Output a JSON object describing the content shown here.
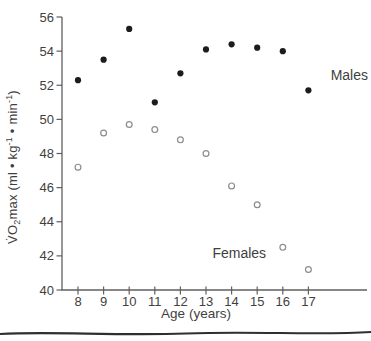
{
  "figure": {
    "background": "#ffffff",
    "axis_color": "#606060",
    "text_color": "#3f3f3f",
    "separator_color": "#2f2f2f"
  },
  "chart_data": {
    "type": "scatter",
    "title": "",
    "x": [
      8,
      9,
      10,
      11,
      12,
      13,
      14,
      15,
      16,
      17
    ],
    "xlabel": "Age (years)",
    "ylabel": "V̇O₂max (ml • kg⁻¹ • min⁻¹)",
    "ylabel_parts": {
      "p1": "V̇O",
      "s1": "2",
      "p2": "max (ml • kg",
      "e1": "-1",
      "p3": " • min",
      "e2": "-1",
      "p4": ")"
    },
    "xlim": [
      7.4,
      19.3
    ],
    "ylim": [
      40,
      56
    ],
    "yticks": [
      40,
      42,
      44,
      46,
      48,
      50,
      52,
      54,
      56
    ],
    "xticks": [
      8,
      9,
      10,
      11,
      12,
      13,
      14,
      15,
      16,
      17
    ],
    "grid": false,
    "legend_position": "inline-annotations",
    "series": [
      {
        "name": "Males",
        "marker": "filled-circle",
        "color": "#1c1c1c",
        "values": [
          52.3,
          53.5,
          55.3,
          51.0,
          52.7,
          54.1,
          54.4,
          54.2,
          54.0,
          51.7
        ]
      },
      {
        "name": "Females",
        "marker": "open-circle",
        "color": "#8c8c8c",
        "values": [
          47.2,
          49.2,
          49.7,
          49.4,
          48.8,
          48.0,
          46.1,
          45.0,
          42.5,
          41.2
        ]
      }
    ],
    "annotations": [
      {
        "text": "Males",
        "age": 18.6,
        "value": 52.3
      },
      {
        "text": "Females",
        "age": 14.3,
        "value": 41.9
      }
    ]
  }
}
